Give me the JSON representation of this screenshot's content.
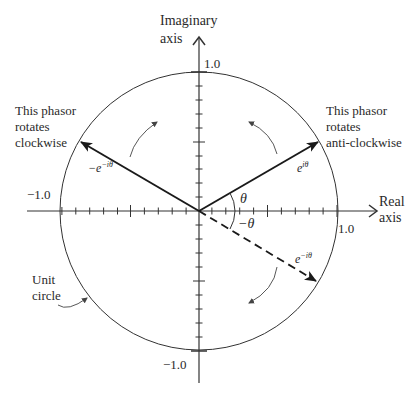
{
  "diagram": {
    "axes": {
      "imaginary_label_line1": "Imaginary",
      "imaginary_label_line2": "axis",
      "real_label_line1": "Real",
      "real_label_line2": "axis",
      "tick_top": "1.0",
      "tick_bottom": "−1.0",
      "tick_left": "−1.0",
      "tick_right": "1.0"
    },
    "phasors": {
      "positive": {
        "label": "e",
        "exponent": "iθ",
        "style": "solid"
      },
      "negative": {
        "label": "−e",
        "exponent": "−iθ",
        "style": "solid"
      },
      "conjugate": {
        "label": "e",
        "exponent": "−iθ",
        "style": "dashed"
      }
    },
    "angles": {
      "theta": "θ",
      "minus_theta": "−θ"
    },
    "annotations": {
      "anticlockwise_line1": "This phasor",
      "anticlockwise_line2": "rotates",
      "anticlockwise_line3": "anti-clockwise",
      "clockwise_line1": "This phasor",
      "clockwise_line2": "rotates",
      "clockwise_line3": "clockwise",
      "unit_circle_line1": "Unit",
      "unit_circle_line2": "circle"
    },
    "colors": {
      "ink": "#2a2a2a",
      "background": "#ffffff"
    }
  }
}
